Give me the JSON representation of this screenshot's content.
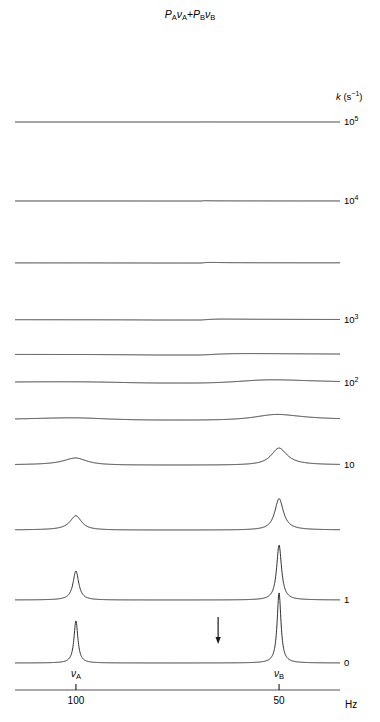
{
  "title": {
    "prefix_p_a": "P",
    "sub_a": "A",
    "nu_a": "ν",
    "plus": "+",
    "prefix_p_b": "P",
    "sub_b": "B",
    "nu_b": "ν",
    "full_text": "P_A ν_A + P_B ν_B"
  },
  "axis": {
    "label": "Hz",
    "ticks": [
      {
        "value": "100",
        "hz": 100
      },
      {
        "value": "50",
        "hz": 50
      }
    ],
    "range_hz": [
      115,
      35
    ],
    "peak_labels": [
      {
        "text": "ν",
        "sub": "A",
        "hz": 100
      },
      {
        "text": "ν",
        "sub": "B",
        "hz": 50
      }
    ]
  },
  "rate_axis": {
    "header": "k (s",
    "header_sup": "−1",
    "header_close": ")",
    "header_text": "k (s⁻¹)"
  },
  "annotations": [
    {
      "name": "coalescence-arrow",
      "glyph": "↓",
      "hz": 65.0
    }
  ],
  "colors": {
    "trace": "#1a1a1a",
    "axis": "#555555",
    "text": "#000000",
    "background": "#ffffff"
  },
  "chart_data": {
    "type": "line",
    "xlabel": "Hz",
    "ylabel": "",
    "xlim": [
      115,
      35
    ],
    "x_reversed": true,
    "grid": false,
    "legend": "right",
    "site_a_hz": 100,
    "site_b_hz": 50,
    "population_a": 0.38,
    "population_b": 0.62,
    "averaged_position_hz": 69,
    "intrinsic_linewidth_hz": 1.1,
    "series": [
      {
        "name": "k = 1e5",
        "k": 100000,
        "label": "10",
        "label_sup": "5",
        "baseline_y": 122,
        "scale": 1.0
      },
      {
        "name": "k = 1e4",
        "k": 10000,
        "label": "10",
        "label_sup": "4",
        "baseline_y": 201,
        "scale": 1.0
      },
      {
        "name": "unlabeled (k ~ 3e3)",
        "k": 3000,
        "label": "",
        "label_sup": "",
        "baseline_y": 263,
        "scale": 1.0
      },
      {
        "name": "k = 1e3",
        "k": 1000,
        "label": "10",
        "label_sup": "3",
        "baseline_y": 320,
        "scale": 1.0
      },
      {
        "name": "unlabeled (k ~ 5e2)",
        "k": 500,
        "label": "",
        "label_sup": "",
        "baseline_y": 355,
        "scale": 1.0
      },
      {
        "name": "k = 1e2",
        "k": 200,
        "label": "10",
        "label_sup": "2",
        "baseline_y": 383,
        "scale": 1.0
      },
      {
        "name": "unlabeled (k ~ 1e2)",
        "k": 110,
        "label": "",
        "label_sup": "",
        "baseline_y": 420,
        "scale": 1.0
      },
      {
        "name": "k = 10",
        "k": 30,
        "label": "10",
        "label_sup": "",
        "baseline_y": 465,
        "scale": 1.0
      },
      {
        "name": "unlabeled (k ~ 10)",
        "k": 12,
        "label": "",
        "label_sup": "",
        "baseline_y": 530,
        "scale": 1.0
      },
      {
        "name": "k = 1",
        "k": 3,
        "label": "1",
        "label_sup": "",
        "baseline_y": 600,
        "scale": 1.0
      },
      {
        "name": "k = 0",
        "k": 0.35,
        "label": "0",
        "label_sup": "",
        "baseline_y": 663,
        "scale": 1.0
      }
    ]
  },
  "geometry": {
    "plot_left_px": 15,
    "plot_right_px": 340,
    "axis_line_y": 690,
    "tick_len_px": 6,
    "rate_label_x": 344,
    "k_header_x": 336,
    "k_header_y": 92,
    "hz_label_x": 345,
    "hz_label_y": 700
  }
}
